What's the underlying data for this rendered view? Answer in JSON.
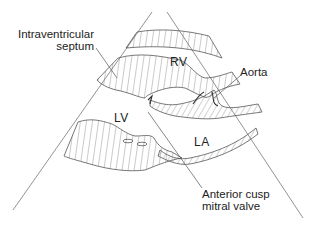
{
  "diagram": {
    "type": "echocardiogram-parasternal-long-axis-schematic",
    "colors": {
      "line": "#555555",
      "hatch": "#666666",
      "text": "#222222",
      "background": "#ffffff"
    },
    "labels": {
      "septum_line1": "Intraventricular",
      "septum_line2": "septum",
      "rv": "RV",
      "aorta": "Aorta",
      "lv": "LV",
      "la": "LA",
      "mitral_line1": "Anterior cusp",
      "mitral_line2": "mitral valve"
    }
  }
}
